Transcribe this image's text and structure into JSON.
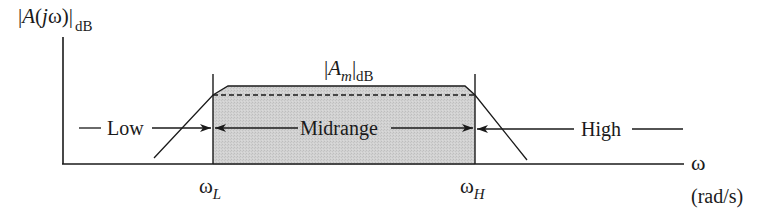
{
  "figure": {
    "y_axis_label": {
      "prefix": "|",
      "A": "A",
      "open": "(",
      "j": "j",
      "omega": "ω",
      "close": ")|",
      "subscript": "dB"
    },
    "midband_gain_label": {
      "prefix": "|",
      "A": "A",
      "m": "m",
      "close": "|",
      "subscript": "dB"
    },
    "regions": {
      "low": "Low",
      "mid": "Midrange",
      "high": "High"
    },
    "x_ticks": {
      "lower": {
        "omega": "ω",
        "sub": "L"
      },
      "upper": {
        "omega": "ω",
        "sub": "H"
      }
    },
    "x_axis_label": {
      "symbol": "ω",
      "units": "(rad/s)"
    },
    "colors": {
      "line": "#1a1a1a",
      "midband_fill": "#d0d0d0"
    }
  }
}
